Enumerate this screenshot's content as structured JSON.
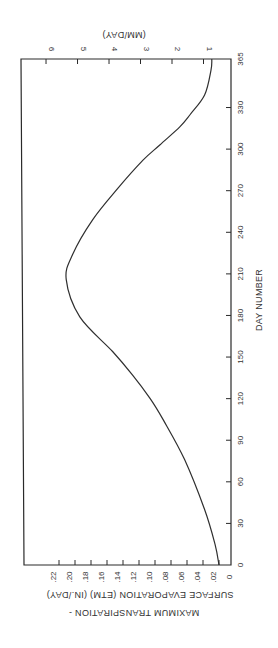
{
  "chart_data": {
    "type": "line",
    "orientation": "rotated 90 degrees clockwise (day axis vertical on right, value axis horizontal at bottom/top)",
    "title": "",
    "xlabel": "DAY NUMBER",
    "ylabel": "MAXIMUM TRANSPIRATION - SURFACE EVAPORATION (ETM) (IN./DAY)",
    "ylabel_line1": "MAXIMUM TRANSPIRATION -",
    "ylabel_line2": "SURFACE EVAPORATION (ETM) (IN./DAY)",
    "y2label": "(MM/DAY)",
    "xlim": [
      0,
      365
    ],
    "ylim": [
      0,
      0.24
    ],
    "x_ticks": [
      "0",
      "30",
      "60",
      "90",
      "120",
      "150",
      "180",
      "210",
      "240",
      "270",
      "300",
      "330",
      "365"
    ],
    "y_ticks": [
      "0",
      ".02",
      ".04",
      ".06",
      ".08",
      ".10",
      ".12",
      ".14",
      ".16",
      ".18",
      ".20",
      ".22"
    ],
    "y2_ticks": [
      "1",
      "2",
      "3",
      "4",
      "5",
      "6"
    ],
    "grid": false,
    "legend": null,
    "series": [
      {
        "name": "ETM",
        "x": [
          0,
          15,
          40,
          76,
          105,
          120,
          137,
          154,
          179,
          206,
          224,
          249,
          272,
          292,
          303,
          316,
          325,
          339,
          357,
          365
        ],
        "values": [
          0.02,
          0.025,
          0.038,
          0.063,
          0.09,
          0.106,
          0.128,
          0.153,
          0.194,
          0.211,
          0.203,
          0.178,
          0.146,
          0.115,
          0.094,
          0.069,
          0.056,
          0.038,
          0.03,
          0.029
        ]
      }
    ]
  }
}
